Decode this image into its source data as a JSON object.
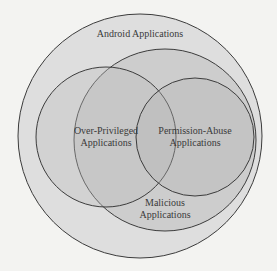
{
  "diagram": {
    "type": "venn",
    "sets": [
      {
        "id": "android",
        "label": "Android Applications",
        "fill": "#dedede"
      },
      {
        "id": "malicious",
        "label_line1": "Malicious",
        "label_line2": "Applications",
        "fill": "#c9c9c9"
      },
      {
        "id": "over_privileged",
        "label_line1": "Over-Privileged",
        "label_line2": "Applications",
        "fill": "#c6c6c6"
      },
      {
        "id": "permission_abuse",
        "label_line1": "Permission-Abuse",
        "label_line2": "Applications",
        "fill": "#bdbdbd"
      }
    ],
    "stroke_color": "#3c3c3c",
    "background": "#f3f3f1"
  }
}
